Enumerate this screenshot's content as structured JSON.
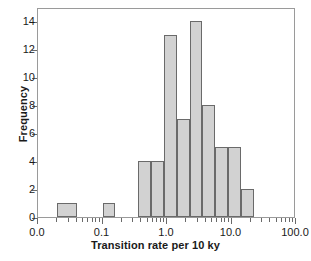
{
  "chart_data": {
    "type": "bar",
    "title": "",
    "xlabel": "Transition rate per 10 ky",
    "ylabel": "Frequency",
    "xscale": "log",
    "xlim": [
      0.01,
      100.0
    ],
    "ylim": [
      0,
      15
    ],
    "grid": false,
    "legend": null,
    "xticks": [
      {
        "value": 0.01,
        "label": "0.0"
      },
      {
        "value": 0.1,
        "label": "0.1"
      },
      {
        "value": 1.0,
        "label": "1.0"
      },
      {
        "value": 10.0,
        "label": "10.0"
      },
      {
        "value": 100.0,
        "label": "100.0"
      }
    ],
    "yticks": [
      {
        "value": 0,
        "label": "0"
      },
      {
        "value": 2,
        "label": "2"
      },
      {
        "value": 4,
        "label": "4"
      },
      {
        "value": 6,
        "label": "6"
      },
      {
        "value": 8,
        "label": "8"
      },
      {
        "value": 10,
        "label": "10"
      },
      {
        "value": 12,
        "label": "12"
      },
      {
        "value": 14,
        "label": "14"
      }
    ],
    "x_minor_ticks": [
      0.02,
      0.03,
      0.04,
      0.05,
      0.06,
      0.07,
      0.08,
      0.09,
      0.2,
      0.3,
      0.4,
      0.5,
      0.6,
      0.7,
      0.8,
      0.9,
      2,
      3,
      4,
      5,
      6,
      7,
      8,
      9,
      20,
      30,
      40,
      50,
      60,
      70,
      80,
      90
    ],
    "bin_edges_log": [
      0.02,
      0.0398,
      0.1,
      0.1585,
      0.3548,
      0.5623,
      0.8913,
      1.4125,
      2.2387,
      3.5481,
      5.6234,
      8.9125,
      14.1254,
      22.3872,
      35.4813
    ],
    "bars": [
      {
        "x0": 0.02,
        "x1": 0.0398,
        "value": 1
      },
      {
        "x0": 0.1,
        "x1": 0.1585,
        "value": 1
      },
      {
        "x0": 0.3548,
        "x1": 0.5623,
        "value": 4
      },
      {
        "x0": 0.5623,
        "x1": 0.8913,
        "value": 4
      },
      {
        "x0": 0.8913,
        "x1": 1.4125,
        "value": 13
      },
      {
        "x0": 1.4125,
        "x1": 2.2387,
        "value": 7
      },
      {
        "x0": 2.2387,
        "x1": 3.5481,
        "value": 14
      },
      {
        "x0": 3.5481,
        "x1": 5.6234,
        "value": 8
      },
      {
        "x0": 5.6234,
        "x1": 8.9125,
        "value": 5
      },
      {
        "x0": 8.9125,
        "x1": 14.1254,
        "value": 5
      },
      {
        "x0": 14.1254,
        "x1": 22.3872,
        "value": 2
      }
    ],
    "values": [
      1,
      1,
      4,
      4,
      13,
      7,
      14,
      8,
      5,
      5,
      2
    ],
    "colors": {
      "bar_fill": "#d2d2d2",
      "bar_edge": "#6a6a6a",
      "frame": "#9a9a9a",
      "text": "#1a1a1a"
    }
  }
}
